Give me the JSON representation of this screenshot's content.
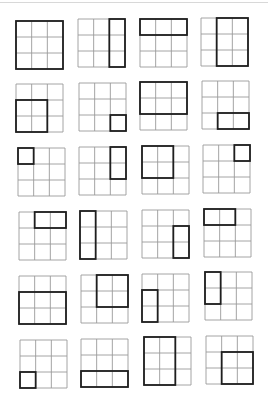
{
  "figure": {
    "grid_rows": 3,
    "grid_cols": 3,
    "colors": {
      "thin_line": "#9a9a9a",
      "bold_line": "#1e1e1e",
      "background": "#ffffff"
    }
  },
  "grids": [
    {
      "x": 16,
      "y": 21,
      "row": 0,
      "col": 0,
      "rowspan": 3,
      "colspan": 3
    },
    {
      "x": 78,
      "y": 19,
      "row": 0,
      "col": 2,
      "rowspan": 3,
      "colspan": 1
    },
    {
      "x": 140,
      "y": 19,
      "row": 0,
      "col": 0,
      "rowspan": 1,
      "colspan": 3
    },
    {
      "x": 201,
      "y": 18,
      "row": 0,
      "col": 1,
      "rowspan": 3,
      "colspan": 2
    },
    {
      "x": 16,
      "y": 84,
      "row": 1,
      "col": 0,
      "rowspan": 2,
      "colspan": 2
    },
    {
      "x": 79,
      "y": 83,
      "row": 2,
      "col": 2,
      "rowspan": 1,
      "colspan": 1
    },
    {
      "x": 140,
      "y": 82,
      "row": 0,
      "col": 0,
      "rowspan": 2,
      "colspan": 3
    },
    {
      "x": 202,
      "y": 81,
      "row": 2,
      "col": 1,
      "rowspan": 1,
      "colspan": 2
    },
    {
      "x": 18,
      "y": 148,
      "row": 0,
      "col": 0,
      "rowspan": 1,
      "colspan": 1
    },
    {
      "x": 79,
      "y": 147,
      "row": 0,
      "col": 2,
      "rowspan": 2,
      "colspan": 1
    },
    {
      "x": 142,
      "y": 146,
      "row": 0,
      "col": 0,
      "rowspan": 2,
      "colspan": 2
    },
    {
      "x": 203,
      "y": 145,
      "row": 0,
      "col": 2,
      "rowspan": 1,
      "colspan": 1
    },
    {
      "x": 19,
      "y": 212,
      "row": 0,
      "col": 1,
      "rowspan": 1,
      "colspan": 2
    },
    {
      "x": 80,
      "y": 211,
      "row": 0,
      "col": 0,
      "rowspan": 3,
      "colspan": 1
    },
    {
      "x": 142,
      "y": 210,
      "row": 1,
      "col": 2,
      "rowspan": 2,
      "colspan": 1
    },
    {
      "x": 204,
      "y": 209,
      "row": 0,
      "col": 0,
      "rowspan": 1,
      "colspan": 2
    },
    {
      "x": 19,
      "y": 276,
      "row": 1,
      "col": 0,
      "rowspan": 2,
      "colspan": 3
    },
    {
      "x": 81,
      "y": 275,
      "row": 0,
      "col": 1,
      "rowspan": 2,
      "colspan": 2
    },
    {
      "x": 142,
      "y": 274,
      "row": 1,
      "col": 0,
      "rowspan": 2,
      "colspan": 1
    },
    {
      "x": 205,
      "y": 272,
      "row": 0,
      "col": 0,
      "rowspan": 2,
      "colspan": 1
    },
    {
      "x": 20,
      "y": 340,
      "row": 2,
      "col": 0,
      "rowspan": 1,
      "colspan": 1
    },
    {
      "x": 81,
      "y": 339,
      "row": 2,
      "col": 0,
      "rowspan": 1,
      "colspan": 3
    },
    {
      "x": 144,
      "y": 337,
      "row": 0,
      "col": 0,
      "rowspan": 3,
      "colspan": 2
    },
    {
      "x": 206,
      "y": 336,
      "row": 1,
      "col": 1,
      "rowspan": 2,
      "colspan": 2
    }
  ]
}
